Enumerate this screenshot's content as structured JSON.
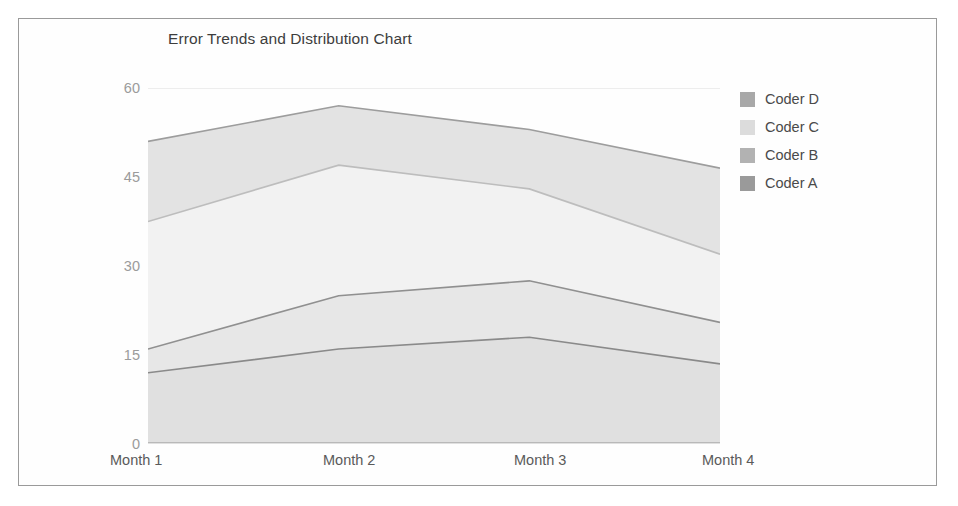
{
  "chart_data": {
    "type": "area",
    "stacked": true,
    "title": "Error Trends and Distribution Chart",
    "xlabel": "",
    "ylabel": "",
    "categories": [
      "Month 1",
      "Month 2",
      "Month 3",
      "Month 4"
    ],
    "ylim": [
      0,
      60
    ],
    "yticks": [
      0,
      15,
      30,
      45,
      60
    ],
    "ytick_labels": [
      "0",
      "15",
      "30",
      "45",
      "60"
    ],
    "grid": true,
    "grid_axis": "y",
    "legend_position": "right",
    "series": [
      {
        "name": "Coder D",
        "values": [
          13.5,
          10.0,
          10.0,
          14.5
        ],
        "cumulative": [
          51.0,
          57.0,
          53.0,
          46.5
        ],
        "color": "#a8a8a8",
        "fill": "#e3e3e3",
        "line": "#9d9d9d"
      },
      {
        "name": "Coder C",
        "values": [
          21.5,
          22.0,
          15.5,
          11.5
        ],
        "cumulative": [
          37.5,
          47.0,
          43.0,
          32.0
        ],
        "color": "#d9d9d9",
        "fill": "#f2f2f2",
        "line": "#bdbdbd"
      },
      {
        "name": "Coder B",
        "values": [
          4.0,
          9.0,
          9.5,
          7.0
        ],
        "cumulative": [
          16.0,
          25.0,
          27.5,
          20.5
        ],
        "color": "#b0b0b0",
        "fill": "#e7e7e7",
        "line": "#909090"
      },
      {
        "name": "Coder A",
        "values": [
          12.0,
          16.0,
          18.0,
          13.5
        ],
        "cumulative": [
          12.0,
          16.0,
          18.0,
          13.5
        ],
        "color": "#9e9e9e",
        "fill": "#e0e0e0",
        "line": "#8a8a8a"
      }
    ]
  },
  "legend": {
    "entries": [
      {
        "label": "Coder D",
        "swatch": "#a8a8a8"
      },
      {
        "label": "Coder C",
        "swatch": "#dcdcdc"
      },
      {
        "label": "Coder B",
        "swatch": "#b2b2b2"
      },
      {
        "label": "Coder A",
        "swatch": "#9a9a9a"
      }
    ]
  },
  "axes": {
    "y_tick_labels": [
      "60",
      "45",
      "30",
      "15",
      "0"
    ],
    "x_tick_labels": [
      "Month 1",
      "Month 2",
      "Month 3",
      "Month 4"
    ]
  }
}
